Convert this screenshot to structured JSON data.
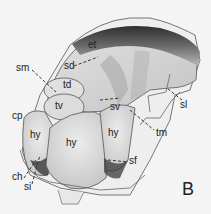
{
  "figure": {
    "panel_label": "B",
    "labels": {
      "et": "et",
      "sd": "sd",
      "sm": "sm",
      "td": "td",
      "tv": "tv",
      "sv": "sv",
      "sl": "sl",
      "cp": "cp",
      "hy_left": "hy",
      "hy_center": "hy",
      "hy_right": "hy",
      "tm": "tm",
      "sf": "sf",
      "ch": "ch",
      "si": "si"
    },
    "colors": {
      "background": "#f4f4f4",
      "outline": "#555555",
      "shade_dark": "#3a3a3a",
      "shade_mid": "#9a9a9a",
      "shade_light": "#d8d8d8"
    }
  }
}
